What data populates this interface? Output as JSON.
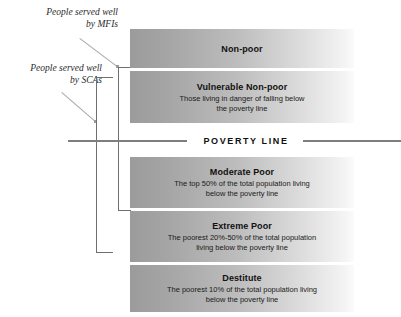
{
  "diagram": {
    "annotations": [
      {
        "id": "mfi",
        "line1": "People served well",
        "line2": "by MFIs"
      },
      {
        "id": "sca",
        "line1": "People served well",
        "line2": "by SCAs"
      }
    ],
    "poverty_line": {
      "label": "POVERTY LINE"
    },
    "bands": [
      {
        "id": "nonpoor",
        "title": "Non-poor",
        "desc_line1": "",
        "desc_line2": ""
      },
      {
        "id": "vulnerable",
        "title": "Vulnerable Non-poor",
        "desc_line1": "Those living in danger of falling below",
        "desc_line2": "the poverty line"
      },
      {
        "id": "moderate",
        "title": "Moderate Poor",
        "desc_line1": "The top 50% of the total population living",
        "desc_line2": "below the poverty line"
      },
      {
        "id": "extreme",
        "title": "Extreme Poor",
        "desc_line1": "The poorest 20%-50% of the total population",
        "desc_line2": "living below the poverty line"
      },
      {
        "id": "destitute",
        "title": "Destitute",
        "desc_line1": "The poorest 10% of the total population living",
        "desc_line2": "below the poverty line"
      }
    ],
    "colors": {
      "band_gradient_start": "#9b9b9b",
      "band_gradient_end": "#fbfbfb",
      "poverty_line_rule": "#7e7e7e",
      "bracket": "#6f6f6f",
      "leader": "#a8a8a8",
      "text": "#111111",
      "background": "#ffffff"
    }
  }
}
